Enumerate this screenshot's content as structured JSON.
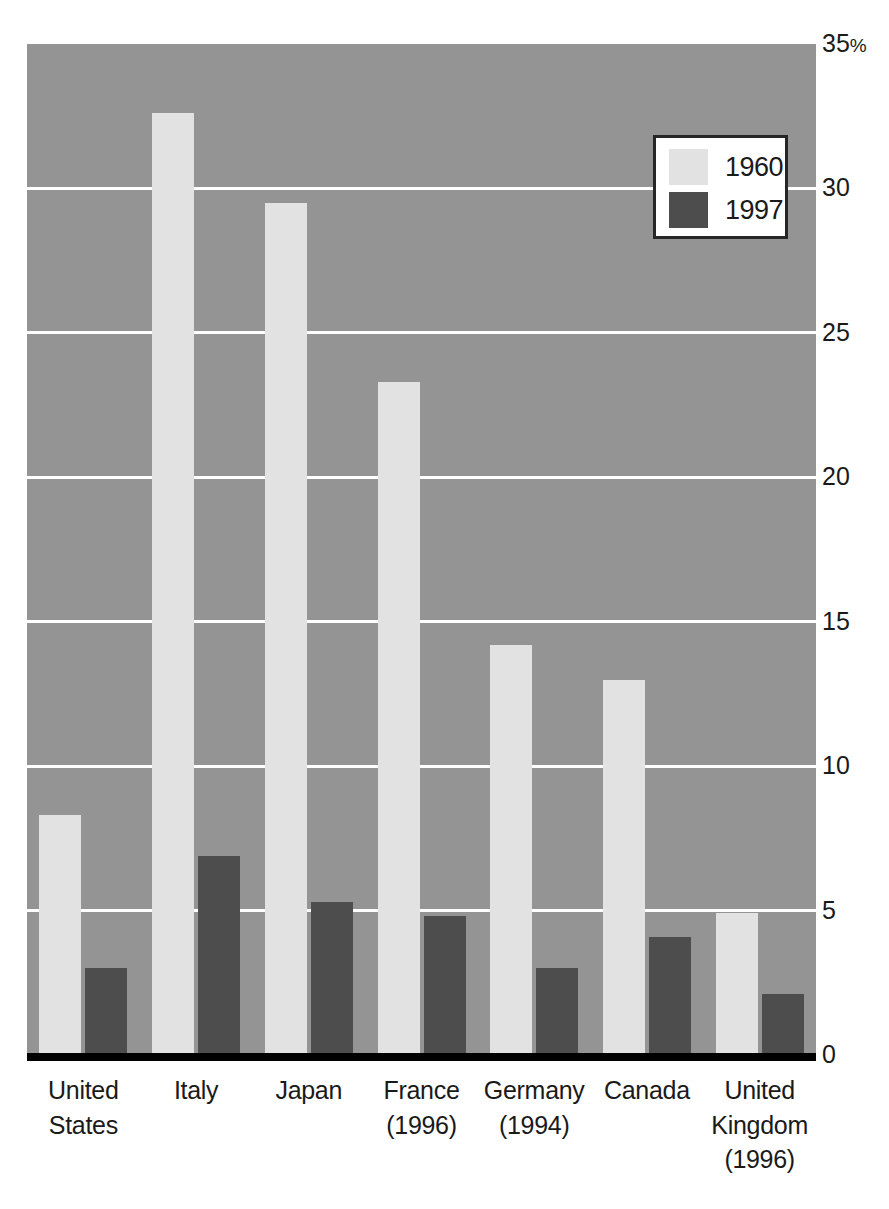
{
  "chart_data": {
    "type": "bar",
    "title": "",
    "subtitle": "",
    "xlabel": "",
    "ylabel": "",
    "ylim": [
      0,
      35
    ],
    "yticks": [
      0,
      5,
      10,
      15,
      20,
      25,
      30,
      35
    ],
    "ytick_labels": [
      "0",
      "5",
      "10",
      "15",
      "20",
      "25",
      "30",
      "35%"
    ],
    "grid": true,
    "grid_axis": "y",
    "legend_position": "top-right",
    "categories": [
      "United States",
      "Italy",
      "Japan",
      "France (1996)",
      "Germany (1994)",
      "Canada",
      "United Kingdom (1996)"
    ],
    "series": [
      {
        "name": "1960",
        "color": "#e2e2e2",
        "values": [
          8.3,
          32.6,
          29.5,
          23.3,
          14.2,
          13.0,
          4.9
        ]
      },
      {
        "name": "1997",
        "color": "#4d4d4d",
        "values": [
          3.0,
          6.9,
          5.3,
          4.8,
          3.0,
          4.1,
          2.1
        ]
      }
    ]
  },
  "axes": {
    "y_ticks": [
      {
        "value": 35,
        "label": "35",
        "suffix": "%"
      },
      {
        "value": 30,
        "label": "30",
        "suffix": ""
      },
      {
        "value": 25,
        "label": "25",
        "suffix": ""
      },
      {
        "value": 20,
        "label": "20",
        "suffix": ""
      },
      {
        "value": 15,
        "label": "15",
        "suffix": ""
      },
      {
        "value": 10,
        "label": "10",
        "suffix": ""
      },
      {
        "value": 5,
        "label": "5",
        "suffix": ""
      },
      {
        "value": 0,
        "label": "0",
        "suffix": ""
      }
    ],
    "x_categories": [
      {
        "lines": [
          "United",
          "States"
        ]
      },
      {
        "lines": [
          "Italy"
        ]
      },
      {
        "lines": [
          "Japan"
        ]
      },
      {
        "lines": [
          "France",
          "(1996)"
        ]
      },
      {
        "lines": [
          "Germany",
          "(1994)"
        ]
      },
      {
        "lines": [
          "Canada"
        ]
      },
      {
        "lines": [
          "United",
          "Kingdom",
          "(1996)"
        ]
      }
    ]
  },
  "legend": {
    "entries": [
      {
        "label": "1960",
        "color": "#e2e2e2"
      },
      {
        "label": "1997",
        "color": "#4d4d4d"
      }
    ]
  },
  "style": {
    "plot_background": "#949494",
    "gridline_color": "#ffffff",
    "baseline_color": "#000000",
    "text_color": "#1a1a1a",
    "legend_background": "#ffffff",
    "legend_border": "#262626"
  }
}
